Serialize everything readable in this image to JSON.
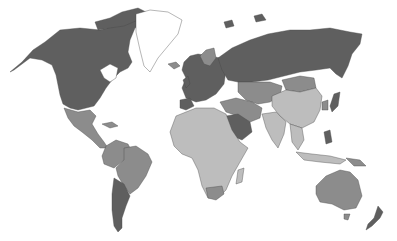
{
  "map": {
    "type": "choropleth",
    "projection": "world",
    "palette": {
      "dark": "#5f5f5f",
      "medium": "#8c8c8c",
      "light": "#bdbdbd",
      "none": "#ffffff",
      "border": "#4a4a4a",
      "ocean": "#ffffff"
    },
    "regions": [
      {
        "name": "North America (Canada, USA, Alaska)",
        "shade": "dark"
      },
      {
        "name": "Greenland",
        "shade": "none"
      },
      {
        "name": "Mexico & Central America",
        "shade": "medium"
      },
      {
        "name": "Northern South America",
        "shade": "medium"
      },
      {
        "name": "Brazil",
        "shade": "medium"
      },
      {
        "name": "Argentina & Chile",
        "shade": "dark"
      },
      {
        "name": "Europe",
        "shade": "dark"
      },
      {
        "name": "Russia",
        "shade": "dark"
      },
      {
        "name": "Central Asia",
        "shade": "medium"
      },
      {
        "name": "Middle East",
        "shade": "medium"
      },
      {
        "name": "Saudi Arabia",
        "shade": "dark"
      },
      {
        "name": "Africa",
        "shade": "light"
      },
      {
        "name": "South Africa",
        "shade": "medium"
      },
      {
        "name": "China",
        "shade": "light"
      },
      {
        "name": "Mongolia",
        "shade": "medium"
      },
      {
        "name": "India",
        "shade": "light"
      },
      {
        "name": "Southeast Asia",
        "shade": "light"
      },
      {
        "name": "Japan",
        "shade": "dark"
      },
      {
        "name": "Philippines",
        "shade": "dark"
      },
      {
        "name": "Australia",
        "shade": "medium"
      },
      {
        "name": "New Zealand",
        "shade": "dark"
      }
    ]
  }
}
